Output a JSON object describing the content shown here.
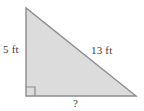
{
  "figure": {
    "type": "right-triangle-diagram",
    "background_color": "#ffffff",
    "fill_color": "#dcdcdc",
    "stroke_color": "#8c8c8c",
    "text_color": "#404040",
    "vertices": {
      "apex": [
        26,
        8
      ],
      "bottom_left": [
        26,
        96
      ],
      "bottom_right": [
        136,
        96
      ]
    },
    "right_angle_marker": {
      "present": true,
      "corner": "bottom-left",
      "size": 9
    },
    "labels": {
      "vertical_leg": "5 ft",
      "hypotenuse": "13 ft",
      "horizontal_leg": "?"
    }
  }
}
